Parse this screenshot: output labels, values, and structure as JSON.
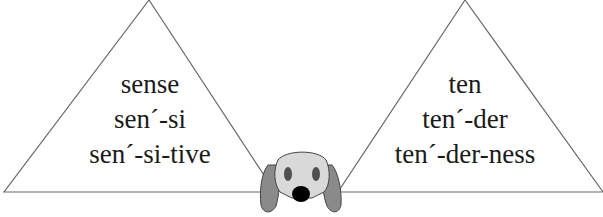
{
  "left_triangle": {
    "lines": [
      "sense",
      "sen´-si",
      "sen´-si-tive"
    ]
  },
  "right_triangle": {
    "lines": [
      "ten",
      "ten´-der",
      "ten´-der-ness"
    ]
  },
  "mascot": {
    "icon": "dog-face-icon"
  },
  "colors": {
    "line": "#6a6a6a",
    "dog_face": "#d9d9d9",
    "dog_ears": "#8a8a8a",
    "dog_eyes": "#505050",
    "dog_nose": "#000000"
  }
}
